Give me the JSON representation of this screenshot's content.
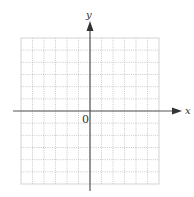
{
  "diagram": {
    "type": "coordinate-grid",
    "x_axis_label": "x",
    "y_axis_label": "y",
    "origin_label": "0",
    "grid": {
      "columns": 12,
      "rows": 12,
      "squares_left_of_y_axis": 6,
      "squares_right_of_y_axis": 6,
      "squares_above_x_axis": 6,
      "squares_below_x_axis": 6,
      "line_style": "dotted"
    },
    "colors": {
      "axis": "#555555",
      "grid": "#bbbbbb",
      "background": "#ffffff"
    }
  }
}
